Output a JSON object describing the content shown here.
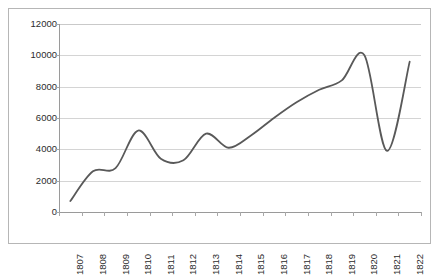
{
  "chart_data": {
    "type": "line",
    "title": "",
    "subtitle": "",
    "xlabel": "",
    "ylabel": "",
    "categories": [
      "1807",
      "1808",
      "1809",
      "1810",
      "1811",
      "1812",
      "1813",
      "1814",
      "1815",
      "1816",
      "1817",
      "1818",
      "1819",
      "1820",
      "1821",
      "1822"
    ],
    "series": [
      {
        "name": "",
        "values": [
          700,
          2600,
          2800,
          5200,
          3400,
          3300,
          5000,
          4100,
          4900,
          6000,
          7000,
          7800,
          8400,
          10000,
          3900,
          9600
        ],
        "color": "#595959",
        "smooth": true,
        "markers": false,
        "line_width": 1.8
      }
    ],
    "ylim": [
      0,
      12000
    ],
    "ytick_values": [
      0,
      2000,
      4000,
      6000,
      8000,
      10000,
      12000
    ],
    "ytick_labels": [
      "0",
      "2000",
      "4000",
      "6000",
      "8000",
      "10000",
      "12000"
    ],
    "grid": {
      "horizontal": true,
      "vertical": false,
      "color": "#d4d4d4"
    },
    "legend": {
      "visible": false,
      "position": "none",
      "entries": []
    },
    "annotations": [],
    "plot_border": "#b6b6b6",
    "background": "#ffffff"
  }
}
